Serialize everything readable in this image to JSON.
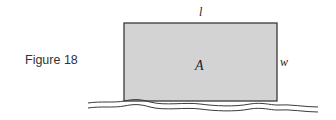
{
  "figure": {
    "caption": "Figure 18",
    "labels": {
      "length": "l",
      "width": "w",
      "area": "A"
    },
    "colors": {
      "fill": "#d2d2d2",
      "stroke": "#333333"
    }
  }
}
